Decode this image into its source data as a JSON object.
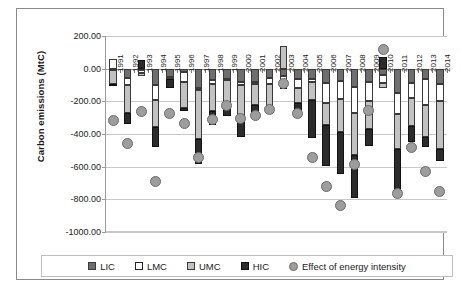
{
  "chart_data": {
    "type": "bar",
    "title": "",
    "xlabel": "",
    "ylabel": "Carbon emissions (MtC)",
    "ylim": [
      -1000,
      200
    ],
    "ytick_labels": [
      "200.00",
      "0.00",
      "-200.00",
      "-400.00",
      "-600.00",
      "-800.00",
      "-1000.00"
    ],
    "ytick_values": [
      200,
      0,
      -200,
      -400,
      -600,
      -800,
      -1000
    ],
    "grid": true,
    "legend_position": "bottom",
    "stacked": true,
    "categories": [
      "1991",
      "1992",
      "1993",
      "1994",
      "1995",
      "1996",
      "1997",
      "1998",
      "1999",
      "2000",
      "2001",
      "2002",
      "2003",
      "2004",
      "2005",
      "2006",
      "2007",
      "2008",
      "2009",
      "2010",
      "2011",
      "2012",
      "2013",
      "2014"
    ],
    "series": [
      {
        "name": "LIC",
        "color": "#6e6e6e",
        "values": [
          -10,
          -58,
          -8,
          -100,
          -52,
          -20,
          -120,
          -72,
          -62,
          -84,
          -80,
          -60,
          -42,
          -62,
          -66,
          -90,
          -78,
          -112,
          -84,
          -40,
          -150,
          -90,
          -62,
          -92
        ]
      },
      {
        "name": "LMC",
        "color": "#ffffff",
        "values": [
          62,
          -44,
          -18,
          -92,
          -6,
          -60,
          -12,
          -20,
          -10,
          -14,
          -12,
          -36,
          -70,
          -56,
          -16,
          -118,
          -110,
          -160,
          -112,
          -48,
          -128,
          -88,
          -162,
          -104
        ]
      },
      {
        "name": "UMC",
        "color": "#c2c2c2",
        "values": [
          -82,
          -172,
          -20,
          -164,
          -8,
          -162,
          -300,
          -168,
          -152,
          -200,
          -130,
          -130,
          138,
          -90,
          -112,
          -136,
          -200,
          -256,
          -176,
          -28,
          -212,
          -174,
          -196,
          -294
        ]
      },
      {
        "name": "HIC",
        "color": "#2b2b2b",
        "values": [
          -14,
          -62,
          52,
          -122,
          -54,
          -20,
          -150,
          -88,
          -66,
          -122,
          -58,
          -36,
          -8,
          -56,
          -232,
          -252,
          -260,
          -264,
          -104,
          70,
          -276,
          -100,
          -60,
          -78
        ]
      },
      {
        "name": "Effect of energy intensity",
        "color": "#9d9d9d",
        "type": "marker",
        "values": [
          -320,
          -456,
          -262,
          -688,
          -276,
          -336,
          -546,
          -310,
          -224,
          -304,
          -288,
          -248,
          -90,
          -274,
          -546,
          -720,
          -840,
          -584,
          -258,
          120,
          -764,
          -480,
          -628,
          -754
        ]
      }
    ],
    "legend_entries": [
      {
        "label": "LIC",
        "swatch": "lic"
      },
      {
        "label": "LMC",
        "swatch": "lmc"
      },
      {
        "label": "UMC",
        "swatch": "umc"
      },
      {
        "label": "HIC",
        "swatch": "hic"
      },
      {
        "label": "Effect of energy intensity",
        "swatch": "dot"
      }
    ]
  }
}
